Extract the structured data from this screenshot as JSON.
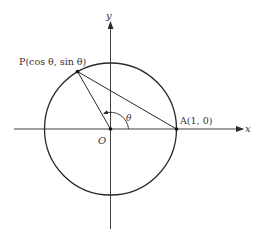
{
  "diagram": {
    "type": "unit-circle",
    "colors": {
      "stroke": "#2a2a2a",
      "text": "#333333",
      "background": "#ffffff"
    },
    "axes": {
      "x_label": "x",
      "y_label": "y"
    },
    "origin": {
      "label": "O"
    },
    "points": {
      "P": {
        "name": "P",
        "coords": "(cos θ, sin θ)",
        "label": "P(cos θ, sin θ)"
      },
      "A": {
        "name": "A",
        "coords": "(1, 0)",
        "label": "A(1, 0)"
      }
    },
    "angle": {
      "label": "θ"
    },
    "segments": [
      "OP",
      "PA"
    ],
    "circle": {
      "description": "unit circle centered at O"
    }
  }
}
